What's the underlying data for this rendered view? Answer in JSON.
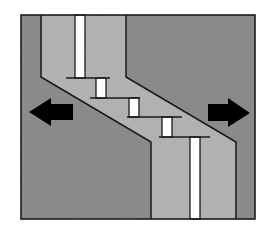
{
  "diagram": {
    "colors": {
      "background": "#ffffff",
      "outer_block": "#8e8e8e",
      "zone_fill": "#b6b6b6",
      "dike_fill": "#ffffff",
      "line": "#1a1a1a",
      "arrow": "#000000"
    },
    "frame": {
      "x": 21,
      "y": 15,
      "width": 234,
      "height": 204
    },
    "zone_polygon": [
      [
        41,
        15
      ],
      [
        126,
        15
      ],
      [
        126,
        77
      ],
      [
        236,
        142
      ],
      [
        236,
        219
      ],
      [
        151,
        219
      ],
      [
        151,
        142
      ],
      [
        41,
        77
      ]
    ],
    "left_boundary": [
      [
        41,
        15
      ],
      [
        41,
        77
      ],
      [
        151,
        142
      ],
      [
        151,
        219
      ]
    ],
    "right_boundary": [
      [
        126,
        15
      ],
      [
        126,
        77
      ],
      [
        236,
        142
      ],
      [
        236,
        219
      ]
    ],
    "dike_segments": [
      {
        "x": 75,
        "y": 15,
        "width": 10,
        "height": 63
      },
      {
        "x": 96,
        "y": 78,
        "width": 10,
        "height": 20
      },
      {
        "x": 129,
        "y": 98,
        "width": 10,
        "height": 19
      },
      {
        "x": 162,
        "y": 117,
        "width": 10,
        "height": 20
      },
      {
        "x": 190,
        "y": 137,
        "width": 10,
        "height": 82
      }
    ],
    "step_lines": [
      {
        "x1": 66,
        "x2": 110,
        "y": 78
      },
      {
        "x1": 90,
        "x2": 140,
        "y": 98
      },
      {
        "x1": 127,
        "x2": 182,
        "y": 117
      },
      {
        "x1": 159,
        "x2": 210,
        "y": 137
      }
    ],
    "arrows": [
      {
        "name": "left-arrow",
        "direction": "left",
        "points": [
          [
            29,
            112
          ],
          [
            51,
            98
          ],
          [
            51,
            104
          ],
          [
            73,
            104
          ],
          [
            73,
            120
          ],
          [
            51,
            120
          ],
          [
            51,
            126
          ]
        ]
      },
      {
        "name": "right-arrow",
        "direction": "right",
        "points": [
          [
            250,
            113
          ],
          [
            228,
            98
          ],
          [
            228,
            104
          ],
          [
            208,
            104
          ],
          [
            208,
            121
          ],
          [
            228,
            121
          ],
          [
            228,
            127
          ]
        ]
      }
    ]
  }
}
